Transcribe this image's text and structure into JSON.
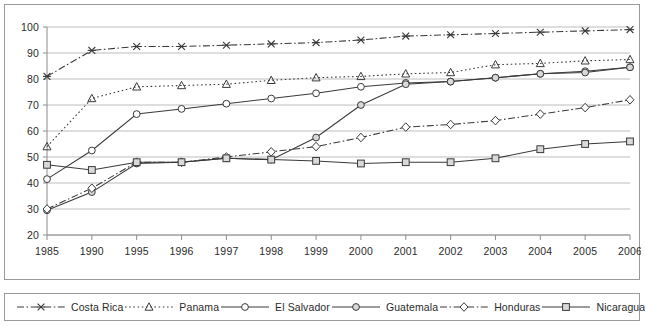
{
  "chart_data": {
    "type": "line",
    "title": "",
    "subtitle": "",
    "xlabel": "",
    "ylabel": "",
    "xlim": [
      0,
      13
    ],
    "ylim": [
      20,
      100
    ],
    "yticks": [
      20,
      30,
      40,
      50,
      60,
      70,
      80,
      90,
      100
    ],
    "grid": true,
    "legend_position": "bottom",
    "categories": [
      "1985",
      "1990",
      "1995",
      "1996",
      "1997",
      "1998",
      "1999",
      "2000",
      "2001",
      "2002",
      "2003",
      "2004",
      "2005",
      "2006"
    ],
    "series": [
      {
        "name": "Costa Rica",
        "marker": "x",
        "line_style": "dash-dot",
        "values": [
          81,
          91,
          92.5,
          92.5,
          93,
          93.5,
          94,
          95,
          96.5,
          97,
          97.5,
          98,
          98.5,
          99
        ]
      },
      {
        "name": "Panama",
        "marker": "triangle",
        "line_style": "dotted",
        "values": [
          54,
          72.5,
          77,
          77.5,
          78,
          79.5,
          80.5,
          81,
          82,
          82.5,
          85.5,
          86,
          87,
          87.5
        ]
      },
      {
        "name": "El Salvador",
        "marker": "circle-open",
        "line_style": "solid",
        "values": [
          41.5,
          52.5,
          66.5,
          68.5,
          70.5,
          72.5,
          74.5,
          77,
          78.5,
          79,
          80.5,
          82,
          83,
          84.5
        ]
      },
      {
        "name": "Guatemala",
        "marker": "circle-filled",
        "line_style": "solid",
        "values": [
          29.5,
          36.5,
          47.5,
          48,
          49.5,
          49,
          57.5,
          70,
          78,
          79,
          80.5,
          82,
          82.5,
          84.5
        ]
      },
      {
        "name": "Honduras",
        "marker": "diamond-open",
        "line_style": "dash-dot",
        "values": [
          30,
          38,
          48,
          48,
          50,
          52,
          54,
          57.5,
          61.5,
          62.5,
          64,
          66.5,
          69,
          72
        ]
      },
      {
        "name": "Nicaragua",
        "marker": "square",
        "line_style": "solid",
        "values": [
          47,
          45,
          48,
          48,
          49.5,
          49,
          48.5,
          47.5,
          48,
          48,
          49.5,
          53,
          55,
          56
        ]
      }
    ]
  },
  "legend": {
    "items": [
      {
        "label": "Costa Rica",
        "marker": "x",
        "line_style": "dash-dot"
      },
      {
        "label": "Panama",
        "marker": "triangle",
        "line_style": "dotted"
      },
      {
        "label": "El Salvador",
        "marker": "circle-open",
        "line_style": "solid"
      },
      {
        "label": "Guatemala",
        "marker": "circle-filled",
        "line_style": "solid"
      },
      {
        "label": "Honduras",
        "marker": "diamond-open",
        "line_style": "dash-dot"
      },
      {
        "label": "Nicaragua",
        "marker": "square",
        "line_style": "solid"
      }
    ]
  },
  "colors": {
    "line": "#3a3a3a",
    "grid": "#bdbdbd",
    "axis": "#8c8c8c",
    "frame": "#9a9a9a",
    "text": "#2b2b2b",
    "marker_fill": "#d9d9d9",
    "background": "#ffffff"
  }
}
